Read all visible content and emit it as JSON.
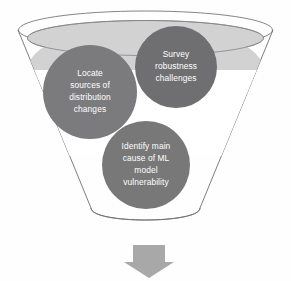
{
  "diagram": {
    "type": "funnel-diagram",
    "title": "",
    "background_color": "#fefefe",
    "funnel": {
      "name": "funnel-outline",
      "outline_color": "#6f6f72",
      "interior_color": "#ffffff",
      "top_ellipse_fill": "#d2d2d2"
    },
    "arrow": {
      "name": "down-arrow",
      "direction": "down",
      "color": "#a8a8a8",
      "label": ""
    },
    "bubbles": [
      {
        "id": "locate-sources",
        "lines": [
          "Locate",
          "sources of",
          "distribution",
          "changes"
        ],
        "full_text": "Locate sources of distribution changes",
        "fill": "#7b7b7e",
        "text_color": "#ffffff",
        "cx": 90,
        "cy": 92,
        "r": 47
      },
      {
        "id": "survey-robustness",
        "lines": [
          "Survey",
          "robustness",
          "challenges"
        ],
        "full_text": "Survey robustness challenges",
        "fill": "#6f6f72",
        "text_color": "#ffffff",
        "cx": 176,
        "cy": 67,
        "r": 41
      },
      {
        "id": "identify-cause",
        "lines": [
          "Identify main",
          "cause of ML",
          "model",
          "vulnerability"
        ],
        "full_text": "Identify main cause of ML model vulnerability",
        "fill": "#787879",
        "text_color": "#ffffff",
        "cx": 146,
        "cy": 165,
        "r": 44
      }
    ]
  }
}
